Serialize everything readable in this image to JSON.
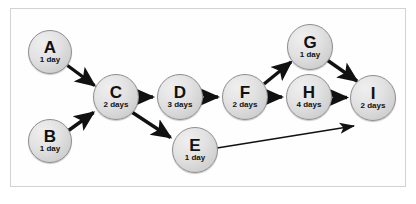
{
  "diagram": {
    "type": "activity-network-diagram",
    "title": "",
    "frame": {
      "border_color": "#d2d2d2",
      "background": "#fefefe"
    },
    "style": {
      "node_fill": "#dcdcdc",
      "node_border": "#8d8d8d",
      "edge_color": "#111111",
      "text_color": "#111111"
    },
    "nodes": [
      {
        "id": "A",
        "label": "A",
        "duration": "1 day",
        "cx": 50,
        "cy": 52,
        "r": 22
      },
      {
        "id": "B",
        "label": "B",
        "duration": "1 day",
        "cx": 50,
        "cy": 141,
        "r": 22
      },
      {
        "id": "C",
        "label": "C",
        "duration": "2 days",
        "cx": 116,
        "cy": 97,
        "r": 23
      },
      {
        "id": "D",
        "label": "D",
        "duration": "3 days",
        "cx": 180,
        "cy": 97,
        "r": 23
      },
      {
        "id": "E",
        "label": "E",
        "duration": "1 day",
        "cx": 195,
        "cy": 150,
        "r": 23
      },
      {
        "id": "F",
        "label": "F",
        "duration": "2 days",
        "cx": 245,
        "cy": 97,
        "r": 23
      },
      {
        "id": "G",
        "label": "G",
        "duration": "1 day",
        "cx": 310,
        "cy": 47,
        "r": 23
      },
      {
        "id": "H",
        "label": "H",
        "duration": "4 days",
        "cx": 309,
        "cy": 97,
        "r": 23
      },
      {
        "id": "I",
        "label": "I",
        "duration": "2 days",
        "cx": 373,
        "cy": 98,
        "r": 23
      }
    ],
    "edges": [
      {
        "from": "A",
        "to": "C",
        "weight": "thick"
      },
      {
        "from": "B",
        "to": "C",
        "weight": "thick"
      },
      {
        "from": "C",
        "to": "D",
        "weight": "thick"
      },
      {
        "from": "C",
        "to": "E",
        "weight": "thick"
      },
      {
        "from": "D",
        "to": "F",
        "weight": "thick"
      },
      {
        "from": "F",
        "to": "G",
        "weight": "thick"
      },
      {
        "from": "F",
        "to": "H",
        "weight": "thick"
      },
      {
        "from": "G",
        "to": "I",
        "weight": "thick"
      },
      {
        "from": "H",
        "to": "I",
        "weight": "thick"
      },
      {
        "from": "E",
        "to": "I",
        "weight": "thin"
      }
    ]
  }
}
